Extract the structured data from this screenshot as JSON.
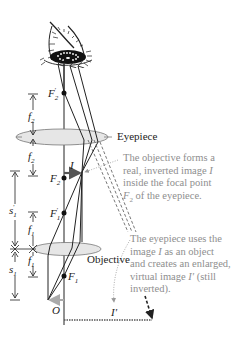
{
  "diagram": {
    "lens_labels": {
      "eyepiece": "Eyepiece",
      "objective": "Objective"
    },
    "point_labels": {
      "f2_prime": "F",
      "f2_prime_sub": "2",
      "f2_prime_mark": "′",
      "f2": "F",
      "f2_sub": "2",
      "f1_prime": "F",
      "f1_prime_sub": "1",
      "f1_prime_mark": "′",
      "f1": "F",
      "f1_sub": "1",
      "object": "O",
      "image": "I",
      "virtual_image": "I′"
    },
    "dimension_labels": {
      "f2_upper": "f",
      "f2_upper_sub": "2",
      "f2_lower": "f",
      "f2_lower_sub": "2",
      "s1_prime": "s",
      "s1_prime_sub": "1",
      "s1_prime_mark": "′",
      "f1_upper": "f",
      "f1_upper_sub": "1",
      "f1_lower": "f",
      "f1_lower_sub": "1",
      "s1": "s",
      "s1_sub": "1"
    },
    "annotations": {
      "objective_note": {
        "line1": "The objective forms a",
        "line2_pre": "real, inverted image ",
        "line2_i": "I",
        "line3": "inside the focal point",
        "line4_f": "F",
        "line4_sub": "2",
        "line4_post": " of the eyepiece."
      },
      "eyepiece_note": {
        "line1": "The eyepiece uses the",
        "line2_pre": "image ",
        "line2_i": "I",
        "line2_post": " as an object",
        "line3": "and creates an enlarged,",
        "line4_pre": "virtual image ",
        "line4_i": "I′",
        "line4_post": " (still",
        "line5": "inverted)."
      }
    },
    "colors": {
      "ray": "#222222",
      "lens_fill": "#e6e6e6",
      "lens_stroke": "#777777",
      "image_arrow": "#555555",
      "object_arrow": "#aaaaaa",
      "note_text": "#8e8e8e",
      "dashed_ray": "#666666"
    }
  }
}
